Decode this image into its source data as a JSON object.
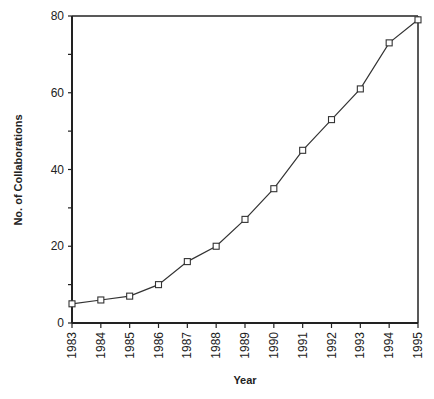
{
  "chart_data": {
    "type": "line",
    "title": "",
    "xlabel": "Year",
    "ylabel": "No. of Collaborations",
    "x": [
      "1983",
      "1984",
      "1985",
      "1986",
      "1987",
      "1988",
      "1989",
      "1990",
      "1991",
      "1992",
      "1993",
      "1994",
      "1995"
    ],
    "series": [
      {
        "name": "Collaborations",
        "values": [
          5,
          6,
          7,
          10,
          16,
          20,
          27,
          35,
          45,
          53,
          61,
          73,
          79
        ],
        "marker": "open-square"
      }
    ],
    "ylim": [
      0,
      80
    ],
    "yticks": [
      0,
      20,
      40,
      60,
      80
    ],
    "grid": false,
    "legend": null
  },
  "colors": {
    "line": "#333333",
    "axis": "#222222",
    "marker_fill": "#ffffff"
  }
}
